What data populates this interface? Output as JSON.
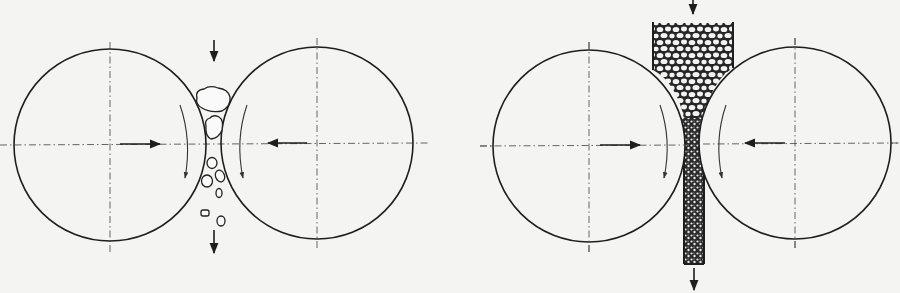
{
  "figure": {
    "background": "#f4f4f2",
    "stroke_color": "#1e1e1e",
    "panels": [
      {
        "id": "single-particle",
        "rolls": [
          {
            "cx": 110,
            "cy": 145,
            "r": 96,
            "force_direction": "right",
            "rotation": "clockwise"
          },
          {
            "cx": 317,
            "cy": 143,
            "r": 96,
            "force_direction": "left",
            "rotation": "counterclockwise"
          }
        ],
        "feed_arrow": "down",
        "discharge_arrow": "down",
        "material": "individual particles"
      },
      {
        "id": "interparticle-bed",
        "rolls": [
          {
            "cx": 589,
            "cy": 146,
            "r": 96,
            "force_direction": "right",
            "rotation": "clockwise"
          },
          {
            "cx": 795,
            "cy": 143,
            "r": 96,
            "force_direction": "left",
            "rotation": "counterclockwise"
          }
        ],
        "feed_arrow": "down",
        "discharge_arrow": "down",
        "material": "packed bed in hopper, compacted flake"
      }
    ]
  }
}
